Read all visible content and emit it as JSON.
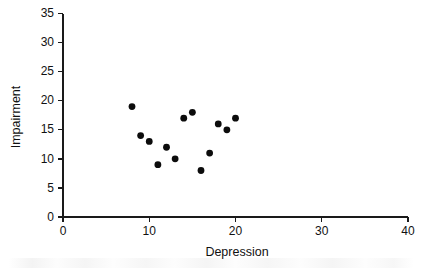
{
  "chart_data": {
    "type": "scatter",
    "title": "",
    "xlabel": "Depression",
    "ylabel": "Impairment",
    "xlim": [
      0,
      40
    ],
    "ylim": [
      0,
      35
    ],
    "xticks": [
      0,
      10,
      20,
      30,
      40
    ],
    "yticks": [
      0,
      5,
      10,
      15,
      20,
      25,
      30,
      35
    ],
    "xtick_labels": [
      "0",
      "10",
      "20",
      "30",
      "40"
    ],
    "ytick_labels": [
      "0",
      "5",
      "10",
      "15",
      "20",
      "25",
      "30",
      "35"
    ],
    "grid": false,
    "legend": null,
    "marker": "filled-circle",
    "marker_color": "#0c0c0c",
    "axis_color": "#1a1a1a",
    "points": [
      {
        "x": 8,
        "y": 19
      },
      {
        "x": 9,
        "y": 14
      },
      {
        "x": 10,
        "y": 13
      },
      {
        "x": 11,
        "y": 9
      },
      {
        "x": 12,
        "y": 12
      },
      {
        "x": 13,
        "y": 10
      },
      {
        "x": 14,
        "y": 17
      },
      {
        "x": 15,
        "y": 18
      },
      {
        "x": 16,
        "y": 8
      },
      {
        "x": 17,
        "y": 11
      },
      {
        "x": 18,
        "y": 16
      },
      {
        "x": 19,
        "y": 15
      },
      {
        "x": 20,
        "y": 17
      }
    ],
    "n_points": 13
  },
  "figure": {
    "background": "#ffffff"
  }
}
